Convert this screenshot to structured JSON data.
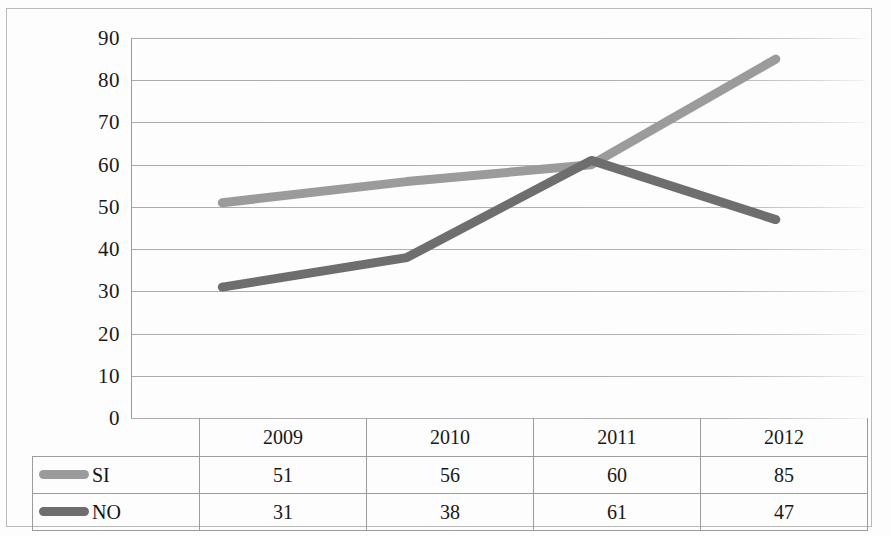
{
  "chart_data": {
    "type": "line",
    "title": "",
    "xlabel": "",
    "ylabel": "",
    "categories": [
      "2009",
      "2010",
      "2011",
      "2012"
    ],
    "series": [
      {
        "name": "SI",
        "values": [
          51,
          56,
          60,
          85
        ],
        "color": "#9b9b9b"
      },
      {
        "name": "NO",
        "values": [
          31,
          38,
          61,
          47
        ],
        "color": "#6e6e6e"
      }
    ],
    "ylim": [
      0,
      90
    ],
    "yticks": [
      90,
      80,
      70,
      60,
      50,
      40,
      30,
      20,
      10,
      0
    ],
    "grid": true,
    "legend_position": "bottom-table",
    "has_data_table": true
  },
  "axis": {
    "yticks": [
      "90",
      "80",
      "70",
      "60",
      "50",
      "40",
      "30",
      "20",
      "10",
      "0"
    ]
  },
  "table": {
    "header": [
      "",
      "2009",
      "2010",
      "2011",
      "2012"
    ],
    "rows": [
      {
        "legend": "SI",
        "swatch_color": "#9b9b9b",
        "values": [
          "51",
          "56",
          "60",
          "85"
        ]
      },
      {
        "legend": "NO",
        "swatch_color": "#6e6e6e",
        "values": [
          "31",
          "38",
          "61",
          "47"
        ]
      }
    ]
  },
  "colors": {
    "si_line": "#9b9b9b",
    "no_line": "#6e6e6e",
    "gridline": "#a9a9a9",
    "frame": "#b9b9b9",
    "text": "#181818"
  }
}
